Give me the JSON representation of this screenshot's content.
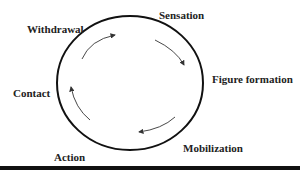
{
  "diagram": {
    "type": "cycle",
    "stages": [
      {
        "id": "sensation",
        "label": "Sensation"
      },
      {
        "id": "figure-formation",
        "label": "Figure formation"
      },
      {
        "id": "mobilization",
        "label": "Mobilization"
      },
      {
        "id": "action",
        "label": "Action"
      },
      {
        "id": "contact",
        "label": "Contact"
      },
      {
        "id": "withdrawal",
        "label": "Withdrawal"
      }
    ],
    "direction": "clockwise",
    "colors": {
      "circle": "#111111",
      "arrows": "#333333",
      "text": "#222222",
      "bottom_bar": "#111111"
    }
  }
}
